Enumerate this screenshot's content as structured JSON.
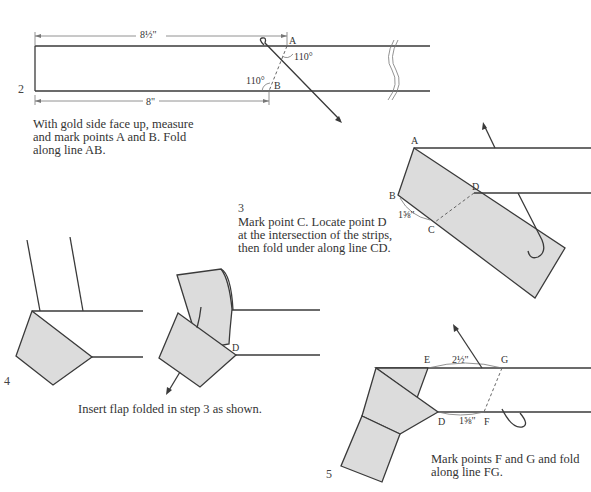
{
  "steps": [
    {
      "number": "2",
      "caption_lines": [
        "With gold side face up, measure",
        "and mark points A and B. Fold",
        "along line AB."
      ],
      "labels": {
        "A": "A",
        "B": "B",
        "angle_top": "110°",
        "angle_bottom": "110°",
        "dim_top": "8½\"",
        "dim_bottom": "8\""
      }
    },
    {
      "number": "3",
      "caption_lines": [
        "Mark point C. Locate point D",
        "at the intersection of the strips,",
        "then fold under along line CD."
      ],
      "labels": {
        "A": "A",
        "B": "B",
        "C": "C",
        "D": "D",
        "dim_bc": "1⅝\""
      }
    },
    {
      "number": "4",
      "caption_lines": [
        "Insert flap folded in step 3 as shown."
      ],
      "labels": {
        "D": "D"
      }
    },
    {
      "number": "5",
      "caption_lines": [
        "Mark points F and G and fold",
        "along line FG."
      ],
      "labels": {
        "E": "E",
        "G": "G",
        "D": "D",
        "F": "F",
        "dim_eg": "2½\"",
        "dim_df": "1⅝\""
      }
    }
  ],
  "colors": {
    "strip_fill": "#dcdcdc",
    "line": "#3a3a3a"
  }
}
